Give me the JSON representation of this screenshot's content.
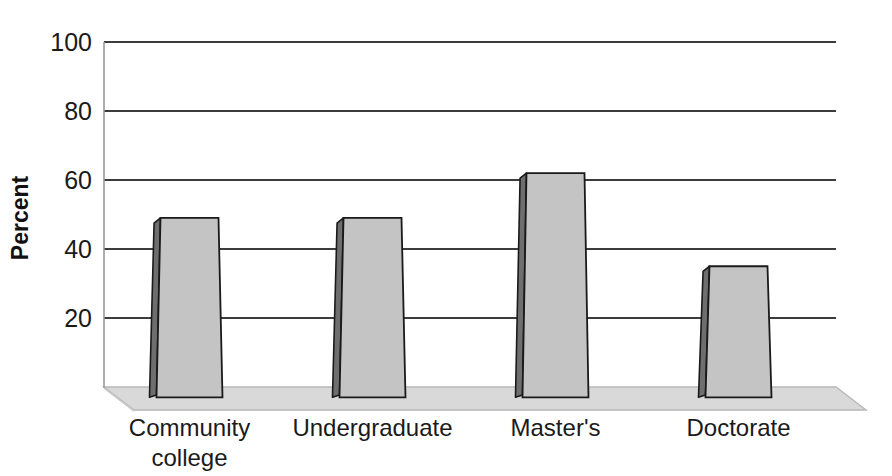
{
  "chart_data": {
    "type": "bar",
    "title": "",
    "subtitle": "",
    "xlabel": "",
    "ylabel": "Percent",
    "categories": [
      "Community college",
      "Undergraduate",
      "Master's",
      "Doctorate"
    ],
    "category_lines": [
      [
        "Community",
        "college"
      ],
      [
        "Undergraduate"
      ],
      [
        "Master's"
      ],
      [
        "Doctorate"
      ]
    ],
    "values": [
      49,
      49,
      62,
      35
    ],
    "ylim": [
      0,
      100
    ],
    "yticks": [
      0,
      20,
      40,
      60,
      80,
      100
    ],
    "ytick_labels": [
      "",
      "20",
      "40",
      "60",
      "80",
      "100"
    ],
    "grid": true,
    "grid_axis": "y",
    "legend": "none",
    "style": "3d-bar",
    "colors": {
      "bar_front": "#c4c4c4",
      "bar_side": "#6e6e6e",
      "bar_top": "#9a9a9a",
      "bar_outline": "#1a1a1a",
      "floor": "#d5d5d5",
      "floor_edge": "#b4b4b4",
      "gridline": "#3c3c3c",
      "axis": "#3c3c3c",
      "background": "#ffffff",
      "text": "#1a1a1a"
    }
  },
  "axis": {
    "y_title": "Percent",
    "ticks": [
      {
        "value": "100"
      },
      {
        "value": "80"
      },
      {
        "value": "60"
      },
      {
        "value": "40"
      },
      {
        "value": "20"
      }
    ]
  },
  "bars": [
    {
      "label_line1": "Community",
      "label_line2": "college",
      "value": 49
    },
    {
      "label_line1": "Undergraduate",
      "label_line2": "",
      "value": 49
    },
    {
      "label_line1": "Master's",
      "label_line2": "",
      "value": 62
    },
    {
      "label_line1": "Doctorate",
      "label_line2": "",
      "value": 35
    }
  ]
}
